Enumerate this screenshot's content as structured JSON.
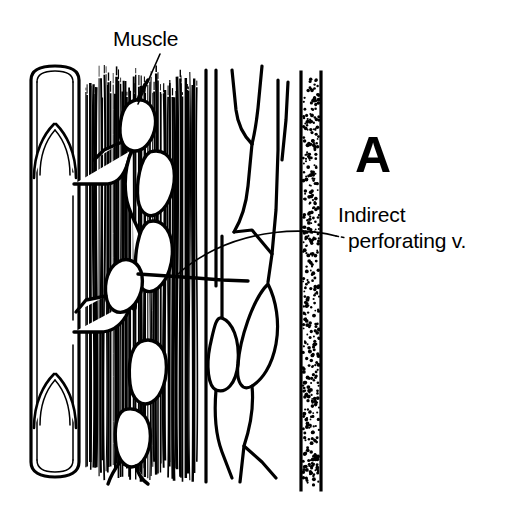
{
  "figure": {
    "panel_letter": "A",
    "background_color": "#ffffff",
    "ink_color": "#000000",
    "width": 508,
    "height": 527
  },
  "labels": [
    {
      "id": "muscle",
      "text": "Muscle",
      "x": 113,
      "y": 46,
      "font_size": 21,
      "leader": "line-down-left"
    },
    {
      "id": "indirect-perforating-line1",
      "text": "Indirect",
      "x": 338,
      "y": 222,
      "font_size": 21,
      "leader": "curved-arc-left"
    },
    {
      "id": "indirect-perforating-line2",
      "text": "perforating v.",
      "x": 348,
      "y": 248,
      "font_size": 21,
      "leader": "none"
    },
    {
      "id": "panel-letter",
      "text": "A",
      "x": 355,
      "y": 172,
      "font_size": 50,
      "leader": "none"
    }
  ],
  "structures": [
    {
      "id": "deep-vein",
      "name": "Deep vein",
      "type": "vessel",
      "x_left": 30,
      "x_right": 80,
      "y_top": 67,
      "y_bottom": 478,
      "valve_count": 2,
      "valve_y": [
        128,
        378
      ]
    },
    {
      "id": "muscle-mass",
      "name": "Muscle",
      "type": "striated-fibers",
      "x_left": 86,
      "x_right": 196,
      "y_top": 72,
      "y_bottom": 482,
      "fiber_count": 62
    },
    {
      "id": "intramuscular-plexus",
      "name": "Intramuscular venous plexus",
      "type": "vein-network",
      "x_left": 72,
      "x_right": 200
    },
    {
      "id": "indirect-perforating-vein",
      "name": "Indirect perforating vein",
      "type": "vein",
      "crosses_fascia_at_y": 281
    },
    {
      "id": "superficial-veins",
      "name": "Superficial vein network",
      "type": "vein-network",
      "x_left": 200,
      "x_right": 300
    },
    {
      "id": "deep-fascia",
      "name": "Deep fascia",
      "type": "stippled-band",
      "x_left": 300,
      "x_right": 322,
      "y_top": 72,
      "y_bottom": 490
    }
  ],
  "colors": {
    "ink": "#000000",
    "paper": "#ffffff"
  }
}
